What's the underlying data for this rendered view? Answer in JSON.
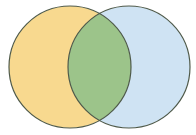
{
  "diagram": {
    "type": "venn",
    "sets": [
      {
        "id": "left",
        "cx": 70,
        "cy": 67,
        "r": 61,
        "fill": "#F8D98F"
      },
      {
        "id": "right",
        "cx": 129,
        "cy": 67,
        "r": 61,
        "fill": "#CFE3F3"
      }
    ],
    "intersection": {
      "fill": "#9CC48A"
    },
    "stroke": "#4F5A4A",
    "stroke_width": 1.2,
    "background": "#FFFFFF"
  }
}
